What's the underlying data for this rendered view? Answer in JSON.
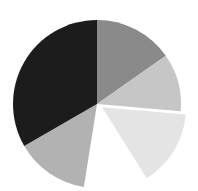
{
  "chart_data": {
    "type": "pie",
    "title": "",
    "legend": [],
    "center": [
      97,
      104
    ],
    "radius": 84,
    "start_angle_deg": 0,
    "direction": "clockwise",
    "slices": [
      {
        "label": "",
        "value": 15.3,
        "start_deg": 0,
        "end_deg": 55,
        "color": "#8a8a8a",
        "explode": 0
      },
      {
        "label": "",
        "value": 11.1,
        "start_deg": 55,
        "end_deg": 95,
        "color": "#c6c6c6",
        "explode": 0
      },
      {
        "label": "",
        "value": 14.7,
        "start_deg": 95,
        "end_deg": 148,
        "color": "#e4e4e4",
        "explode": 6
      },
      {
        "label": "",
        "value": 11.4,
        "start_deg": 148,
        "end_deg": 189,
        "color": "#ffffff",
        "explode": 0
      },
      {
        "label": "",
        "value": 14.2,
        "start_deg": 189,
        "end_deg": 240,
        "color": "#b2b2b2",
        "explode": 0
      },
      {
        "label": "",
        "value": 33.3,
        "start_deg": 240,
        "end_deg": 360,
        "color": "#1c1c1c",
        "explode": 0
      }
    ],
    "values": [
      15.3,
      11.1,
      14.7,
      11.4,
      14.2,
      33.3
    ],
    "categories": [
      "",
      "",
      "",
      "",
      "",
      ""
    ]
  }
}
